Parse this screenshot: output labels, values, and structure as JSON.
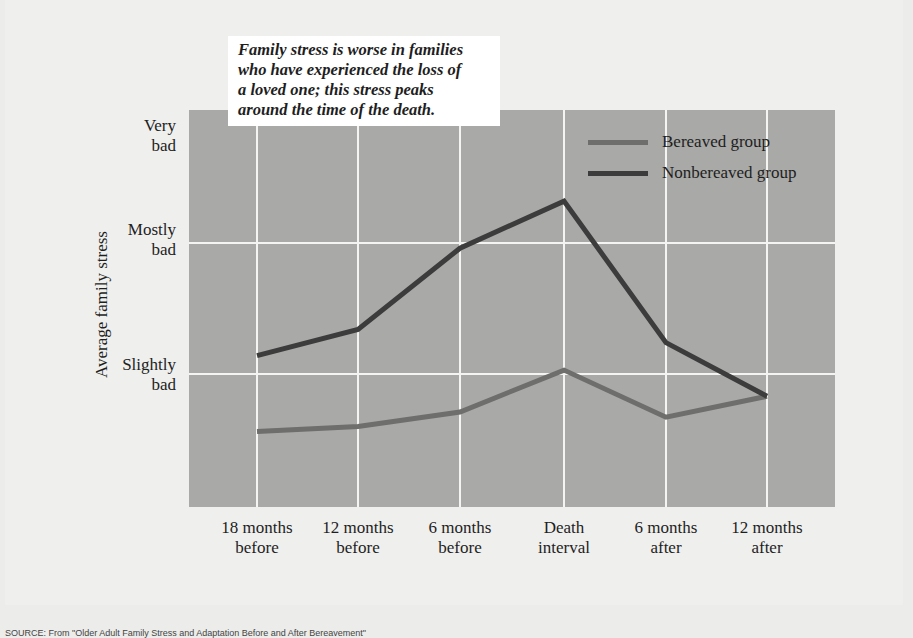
{
  "callout": {
    "lines": [
      "Family stress is worse in families",
      "who have experienced the loss of",
      "a loved one; this stress peaks",
      "around the time of the death."
    ]
  },
  "legend": {
    "bereaved": "Bereaved group",
    "nonbereaved": "Nonbereaved group"
  },
  "axes": {
    "ylabel": "Average family stress",
    "yticks": [
      {
        "line1": "Very",
        "line2": "bad"
      },
      {
        "line1": "Mostly",
        "line2": "bad"
      },
      {
        "line1": "Slightly",
        "line2": "bad"
      }
    ],
    "xticks": [
      {
        "line1": "18 months",
        "line2": "before"
      },
      {
        "line1": "12 months",
        "line2": "before"
      },
      {
        "line1": "6 months",
        "line2": "before"
      },
      {
        "line1": "Death",
        "line2": "interval"
      },
      {
        "line1": "6 months",
        "line2": "after"
      },
      {
        "line1": "12 months",
        "line2": "after"
      }
    ]
  },
  "colors": {
    "plot_bg": "#a9a9a7",
    "grid": "#f4f4f2",
    "bereaved": "#6e6e6c",
    "nonbereaved": "#3c3c3c",
    "page_bg": "#ececea"
  },
  "source_note": "SOURCE: From \"Older Adult Family Stress and Adaptation Before and After Bereavement\"",
  "chart_data": {
    "type": "line",
    "title": "Family stress is worse in families who have experienced the loss of a loved one; this stress peaks around the time of the death.",
    "xlabel": "",
    "ylabel": "Average family stress",
    "categories": [
      "18 months before",
      "12 months before",
      "6 months before",
      "Death interval",
      "6 months after",
      "12 months after"
    ],
    "y_scale_note": "0 = baseline, 1 = Slightly bad, 2 = Mostly bad, 3 = Very bad",
    "ytick_labels": [
      "Slightly bad",
      "Mostly bad",
      "Very bad"
    ],
    "ytick_values": [
      1,
      2,
      3
    ],
    "ylim": [
      0,
      3
    ],
    "grid": true,
    "legend_position": "upper right",
    "series": [
      {
        "name": "Bereaved group",
        "values": [
          0.56,
          0.6,
          0.71,
          1.03,
          0.67,
          0.83
        ]
      },
      {
        "name": "Nonbereaved group",
        "values": [
          1.14,
          1.34,
          1.96,
          2.32,
          1.24,
          0.83
        ]
      }
    ]
  }
}
